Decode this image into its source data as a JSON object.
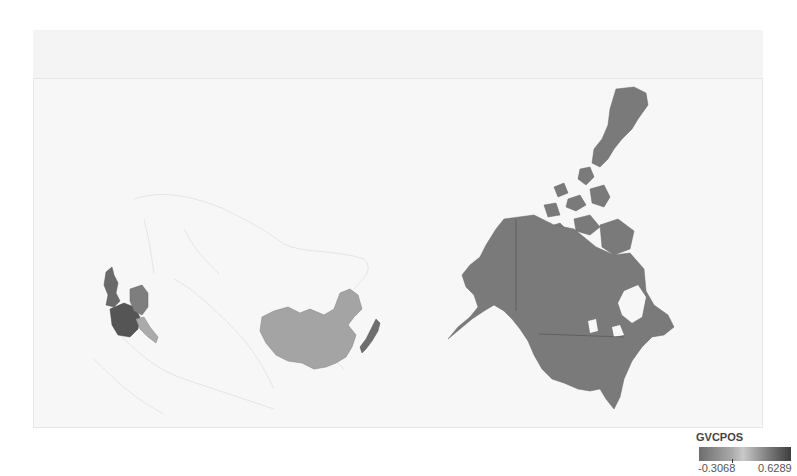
{
  "map": {
    "type": "choropleth",
    "variable": "GVCPOS",
    "colors": {
      "background": "#f7f7f7",
      "no_data_outline": "#e2e2e2",
      "north_america": "#7a7a7a",
      "china": "#a4a4a4",
      "japan": "#6e6e6e",
      "uk": "#6a6a6a",
      "france": "#555555",
      "germany": "#7e7e7e",
      "italy": "#aaaaaa"
    },
    "regions": [
      {
        "name": "Canada",
        "shade": "mid-dark"
      },
      {
        "name": "United States",
        "shade": "mid-dark"
      },
      {
        "name": "China",
        "shade": "light"
      },
      {
        "name": "Japan",
        "shade": "dark"
      },
      {
        "name": "United Kingdom",
        "shade": "dark"
      },
      {
        "name": "France",
        "shade": "darkest"
      },
      {
        "name": "Germany",
        "shade": "mid"
      },
      {
        "name": "Italy",
        "shade": "light"
      }
    ]
  },
  "legend": {
    "title": "GVCPOS",
    "min_label": "-0.3068",
    "max_label": "0.6289"
  }
}
